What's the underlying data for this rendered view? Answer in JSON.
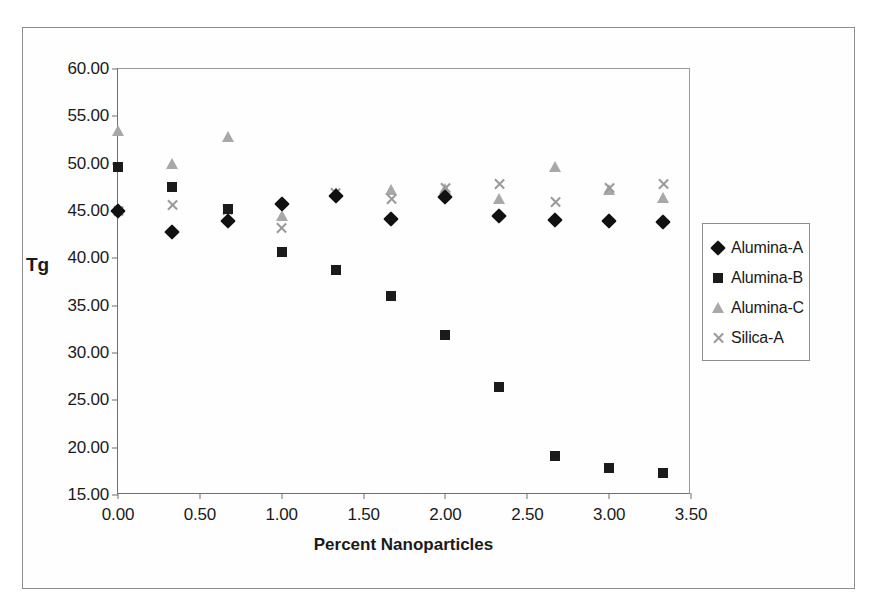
{
  "chart_data": {
    "type": "scatter",
    "title": "",
    "xlabel": "Percent Nanoparticles",
    "ylabel": "Tg",
    "xlim": [
      0.0,
      3.5
    ],
    "ylim": [
      15.0,
      60.0
    ],
    "xticks": [
      "0.00",
      "0.50",
      "1.00",
      "1.50",
      "2.00",
      "2.50",
      "3.00",
      "3.50"
    ],
    "xtick_values": [
      0.0,
      0.5,
      1.0,
      1.5,
      2.0,
      2.5,
      3.0,
      3.5
    ],
    "yticks": [
      "15.00",
      "20.00",
      "25.00",
      "30.00",
      "35.00",
      "40.00",
      "45.00",
      "50.00",
      "55.00",
      "60.00"
    ],
    "ytick_values": [
      15,
      20,
      25,
      30,
      35,
      40,
      45,
      50,
      55,
      60
    ],
    "grid": false,
    "legend_position": "right",
    "x": [
      0.0,
      0.33,
      0.67,
      1.0,
      1.33,
      1.67,
      2.0,
      2.33,
      2.67,
      3.0,
      3.33
    ],
    "series": [
      {
        "name": "Alumina-A",
        "marker": "diamond",
        "color": "#111111",
        "values": [
          45.0,
          42.8,
          43.9,
          45.7,
          46.6,
          44.2,
          46.5,
          44.5,
          44.0,
          43.9,
          43.8
        ]
      },
      {
        "name": "Alumina-B",
        "marker": "square",
        "color": "#1b1b1b",
        "values": [
          49.6,
          47.5,
          45.2,
          40.7,
          38.8,
          36.0,
          31.9,
          26.4,
          19.1,
          17.8,
          17.3
        ]
      },
      {
        "name": "Alumina-C",
        "marker": "triangle",
        "color": "#a8a8a8",
        "values": [
          53.4,
          50.0,
          52.8,
          44.5,
          46.9,
          47.2,
          47.3,
          46.3,
          49.6,
          47.2,
          46.4
        ]
      },
      {
        "name": "Silica-A",
        "marker": "x",
        "color": "#9a9a9a",
        "values": [
          45.0,
          45.6,
          45.1,
          43.2,
          46.9,
          46.3,
          47.4,
          47.8,
          46.0,
          47.4,
          47.9
        ]
      }
    ]
  },
  "legend": {
    "items": [
      {
        "label": "Alumina-A",
        "marker": "diamond"
      },
      {
        "label": "Alumina-B",
        "marker": "square"
      },
      {
        "label": "Alumina-C",
        "marker": "triangle"
      },
      {
        "label": "Silica-A",
        "marker": "x"
      }
    ]
  }
}
